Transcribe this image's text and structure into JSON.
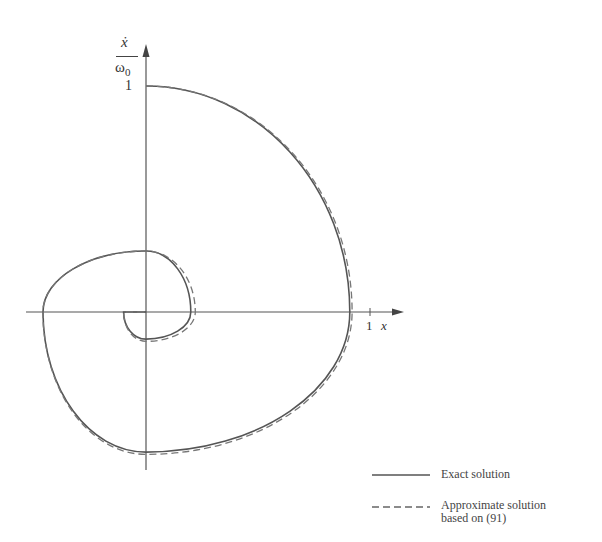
{
  "chart_data": {
    "type": "line",
    "title": "",
    "xlabel": "x",
    "ylabel": "ẋ / ω0",
    "x_ticks": [
      {
        "value": 1,
        "label": "1"
      }
    ],
    "y_ticks": [
      {
        "value": 1,
        "label": "1"
      }
    ],
    "xlim": [
      -0.55,
      1.15
    ],
    "ylim": [
      -0.7,
      1.25
    ],
    "grid": false,
    "legend_position": "bottom-right",
    "series": [
      {
        "name": "Exact solution",
        "style": "solid",
        "description": "Damped phase-plane spiral starting at (0, 1), spiraling clockwise into the origin",
        "key_points": [
          {
            "x": 0.0,
            "y": 1.0
          },
          {
            "x": 0.91,
            "y": 0.0
          },
          {
            "x": 0.0,
            "y": -0.62
          },
          {
            "x": -0.46,
            "y": 0.0
          },
          {
            "x": 0.0,
            "y": 0.27
          },
          {
            "x": 0.2,
            "y": 0.0
          },
          {
            "x": 0.0,
            "y": -0.12
          },
          {
            "x": -0.1,
            "y": 0.0
          },
          {
            "x": 0.0,
            "y": 0.0
          }
        ]
      },
      {
        "name": "Approximate solution based on (91)",
        "style": "dashed",
        "description": "Closely tracks exact solution, slightly outside it on the first right-hand arc and inner loops",
        "key_points": [
          {
            "x": 0.0,
            "y": 1.0
          },
          {
            "x": 0.92,
            "y": 0.0
          },
          {
            "x": 0.0,
            "y": -0.63
          },
          {
            "x": -0.46,
            "y": 0.0
          },
          {
            "x": 0.0,
            "y": 0.27
          },
          {
            "x": 0.22,
            "y": 0.0
          },
          {
            "x": 0.0,
            "y": -0.13
          },
          {
            "x": -0.1,
            "y": 0.0
          },
          {
            "x": 0.0,
            "y": 0.0
          }
        ]
      }
    ]
  },
  "axes": {
    "y_label_numerator": "ẋ",
    "y_label_denominator": "ω",
    "y_label_subscript": "0",
    "y_tick_one": "1",
    "x_tick_one": "1",
    "x_label": "x"
  },
  "legend": {
    "exact_label": "Exact solution",
    "approx_label_line1": "Approximate solution",
    "approx_label_line2": "based on (91)"
  }
}
